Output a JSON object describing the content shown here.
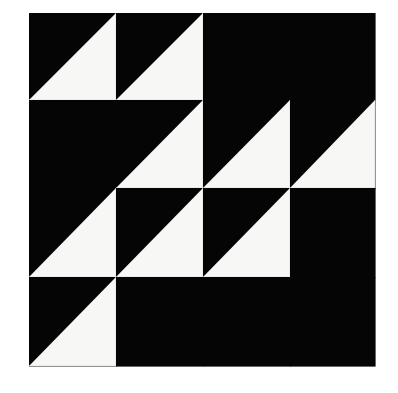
{
  "image": {
    "subject": "quilt-block-half-square-triangles",
    "background_color": "#ffffff",
    "colors": {
      "dark": "#050505",
      "light": "#f7f7f5"
    },
    "grid": {
      "rows": 4,
      "cols": 4,
      "col_edges": [
        29,
        116,
        203,
        290,
        375
      ],
      "row_edges": [
        13,
        100,
        188,
        277,
        366
      ]
    },
    "legend": {
      "B": "solid dark square",
      "BW": "half-square triangle: dark upper-left, light lower-right (diagonal from bottom-left to top-right)"
    },
    "cells": [
      [
        "BW",
        "BW",
        "B",
        "B"
      ],
      [
        "B",
        "BW",
        "BW",
        "BW"
      ],
      [
        "BW",
        "BW",
        "BW",
        "B"
      ],
      [
        "BW",
        "B",
        "B",
        "B"
      ]
    ]
  }
}
